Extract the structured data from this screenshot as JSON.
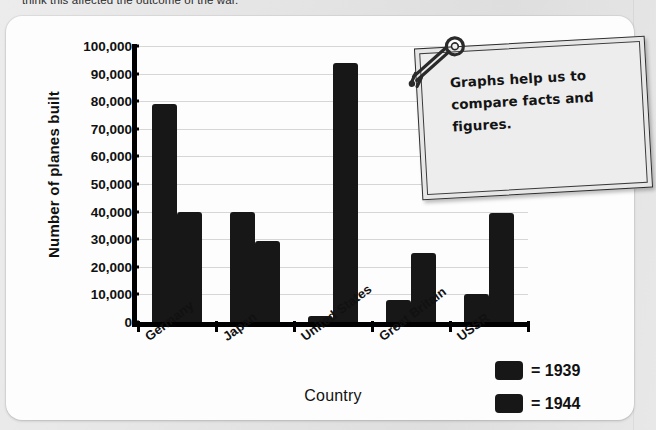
{
  "page": {
    "cropped_top_sentence": "think this affected the outcome of the war."
  },
  "note": {
    "text": "Graphs help us to compare facts and figures.",
    "pin_icon": "key-pin-icon"
  },
  "legend": {
    "items": [
      {
        "label": "= 1939",
        "color": "#171717"
      },
      {
        "label": "= 1944",
        "color": "#171717"
      }
    ]
  },
  "chart_data": {
    "type": "bar",
    "title": "",
    "xlabel": "Country",
    "ylabel": "Number of planes built",
    "categories": [
      "Germany",
      "Japan",
      "United States",
      "Great Britain",
      "USSR"
    ],
    "series": [
      {
        "name": "1939",
        "values": [
          79000,
          40000,
          2000,
          8000,
          10000
        ],
        "color": "#171717"
      },
      {
        "name": "1944",
        "values": [
          39800,
          29500,
          94000,
          25000,
          39500
        ],
        "color": "#171717"
      }
    ],
    "ylim": [
      0,
      100000
    ],
    "ytick_step": 10000,
    "ytick_labels": [
      "0",
      "10,000",
      "20,000",
      "30,000",
      "40,000",
      "50,000",
      "60,000",
      "70,000",
      "80,000",
      "90,000",
      "100,000"
    ],
    "grid": true,
    "legend_position": "bottom-right"
  }
}
